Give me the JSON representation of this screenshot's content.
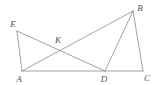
{
  "figure": {
    "canvas": {
      "width": 160,
      "height": 85
    },
    "background_color": "#ffffff",
    "line_color": "#8a8a8a",
    "label_color": "#555555",
    "points": [
      {
        "id": "E",
        "label": "E",
        "x": 17,
        "y": 31,
        "label_x": 13,
        "label_y": 24
      },
      {
        "id": "B",
        "label": "B",
        "x": 133,
        "y": 11,
        "label_x": 140,
        "label_y": 8
      },
      {
        "id": "K",
        "label": "K",
        "x": 60,
        "y": 50,
        "label_x": 58,
        "label_y": 40
      },
      {
        "id": "A",
        "label": "A",
        "x": 22,
        "y": 71,
        "label_x": 19,
        "label_y": 79
      },
      {
        "id": "D",
        "label": "D",
        "x": 105,
        "y": 71,
        "label_x": 104,
        "label_y": 79
      },
      {
        "id": "C",
        "label": "C",
        "x": 143,
        "y": 71,
        "label_x": 147,
        "label_y": 78
      }
    ],
    "segments": [
      {
        "id": "EA",
        "from": "E",
        "to": "A",
        "x1": 17,
        "y1": 31,
        "x2": 22,
        "y2": 71
      },
      {
        "id": "ED",
        "from": "E",
        "to": "D",
        "x1": 17,
        "y1": 31,
        "x2": 105,
        "y2": 71
      },
      {
        "id": "AB",
        "from": "A",
        "to": "B",
        "x1": 22,
        "y1": 71,
        "x2": 133,
        "y2": 11
      },
      {
        "id": "AC",
        "from": "A",
        "to": "C",
        "x1": 22,
        "y1": 71,
        "x2": 143,
        "y2": 71
      },
      {
        "id": "BD",
        "from": "B",
        "to": "D",
        "x1": 133,
        "y1": 11,
        "x2": 105,
        "y2": 71
      },
      {
        "id": "BC",
        "from": "B",
        "to": "C",
        "x1": 133,
        "y1": 11,
        "x2": 143,
        "y2": 71
      }
    ]
  }
}
